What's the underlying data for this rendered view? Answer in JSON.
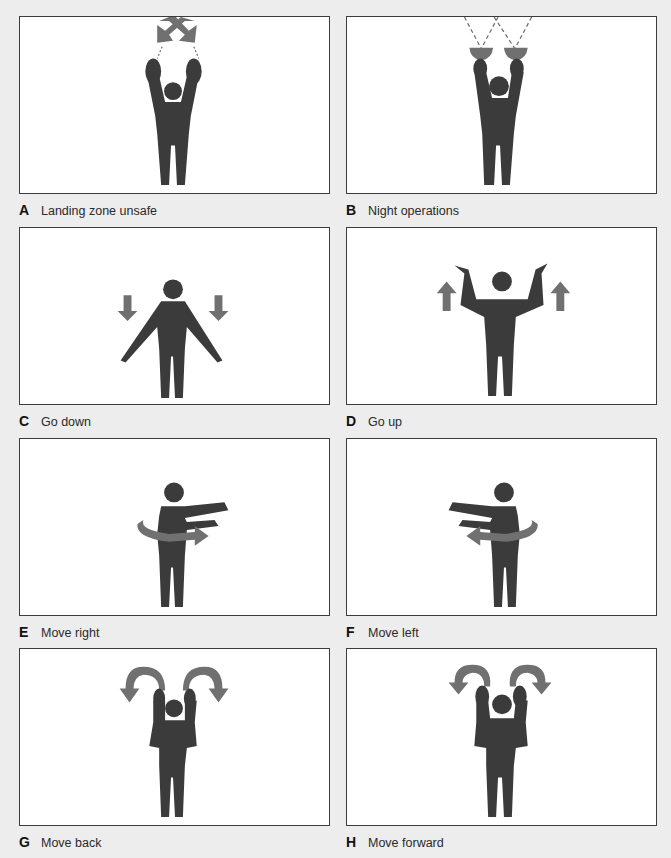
{
  "figure": {
    "type": "hand-signal diagram",
    "colors": {
      "background": "#ededed",
      "panel": "#ffffff",
      "border": "#3c3c3c",
      "figure": "#3b3b3b",
      "arrow": "#707070"
    },
    "panels": [
      {
        "letter": "A",
        "caption": "Landing zone unsafe",
        "icon": "crossed-arrows-overhead-icon"
      },
      {
        "letter": "B",
        "caption": "Night operations",
        "icon": "flashlights-overhead-icon"
      },
      {
        "letter": "C",
        "caption": "Go down",
        "icon": "down-arrows-icon"
      },
      {
        "letter": "D",
        "caption": "Go up",
        "icon": "up-arrows-icon"
      },
      {
        "letter": "E",
        "caption": "Move right",
        "icon": "rotate-right-arrow-icon"
      },
      {
        "letter": "F",
        "caption": "Move left",
        "icon": "rotate-left-arrow-icon"
      },
      {
        "letter": "G",
        "caption": "Move back",
        "icon": "curved-outward-arrows-icon"
      },
      {
        "letter": "H",
        "caption": "Move forward",
        "icon": "curved-inward-arrows-icon"
      }
    ]
  }
}
